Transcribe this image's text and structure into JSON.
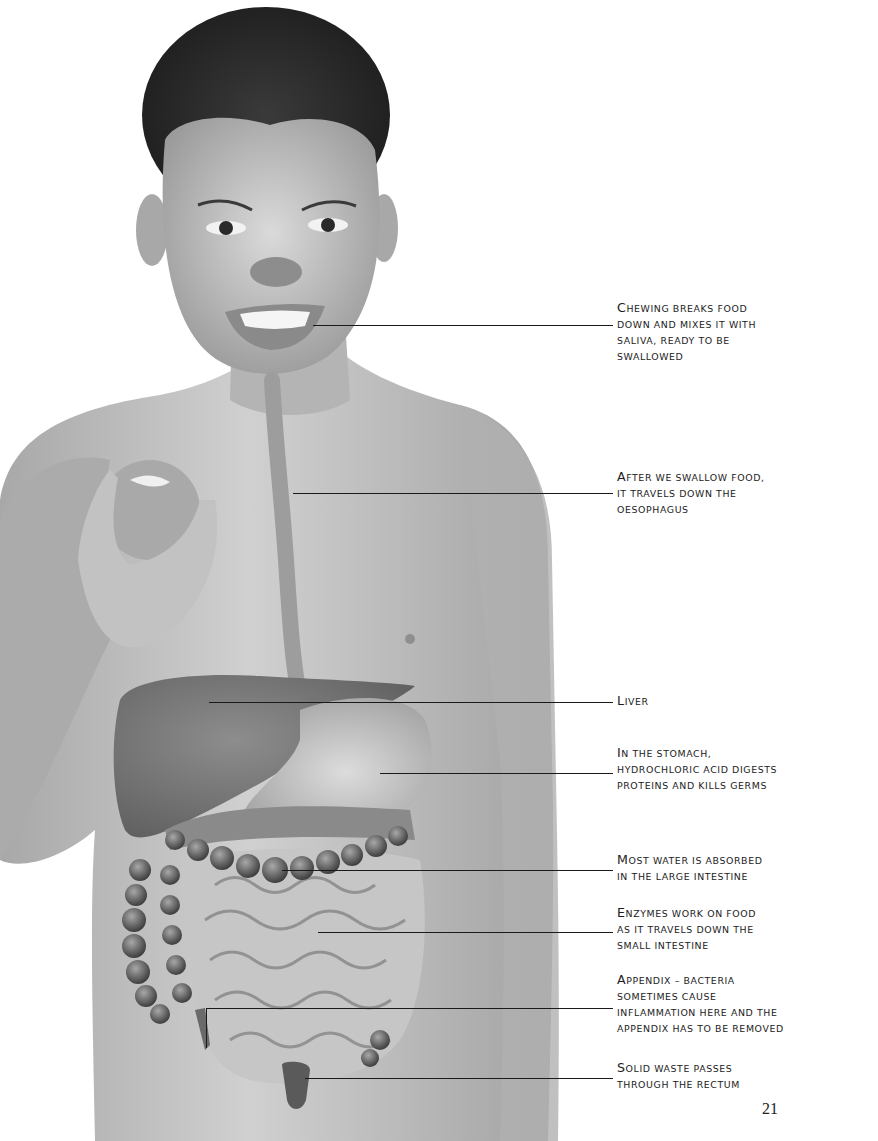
{
  "page": {
    "number": "21",
    "background": "#ffffff"
  },
  "illustration": {
    "subject": "child holding apple with digestive system overlay",
    "colors": {
      "skin": "#b9b9b9",
      "skin_light": "#d2d2d2",
      "hair": "#2a2a2a",
      "organ_dark": "#6e6e6e",
      "organ_mid": "#9a9a9a",
      "intestine": "#c9c9c9"
    }
  },
  "labels": [
    {
      "id": "mouth",
      "first": "C",
      "rest": "hewing breaks food",
      "lines": [
        "down and mixes it with",
        "saliva, ready to be",
        "swallowed"
      ],
      "top": 300,
      "line": {
        "x1": 313,
        "x2": 613,
        "y": 325
      }
    },
    {
      "id": "oesophagus",
      "first": "A",
      "rest": "fter we swallow food,",
      "lines": [
        "it travels down the",
        "oesophagus"
      ],
      "top": 469,
      "line": {
        "x1": 293,
        "x2": 613,
        "y": 493
      }
    },
    {
      "id": "liver",
      "first": "L",
      "rest": "iver",
      "lines": [],
      "top": 693,
      "line": {
        "x1": 209,
        "x2": 613,
        "y": 702
      }
    },
    {
      "id": "stomach",
      "first": "I",
      "rest": "n the stomach,",
      "lines": [
        "hydrochloric acid digests",
        "proteins and kills germs"
      ],
      "top": 745,
      "line": {
        "x1": 380,
        "x2": 613,
        "y": 773
      }
    },
    {
      "id": "large-intestine",
      "first": "M",
      "rest": "ost water is absorbed",
      "lines": [
        "in the large intestine"
      ],
      "top": 852,
      "line": {
        "x1": 282,
        "x2": 613,
        "y": 870
      }
    },
    {
      "id": "small-intestine",
      "first": "E",
      "rest": "nzymes work on food",
      "lines": [
        "as it travels down the",
        "small intestine"
      ],
      "top": 905,
      "line": {
        "x1": 318,
        "x2": 613,
        "y": 932
      }
    },
    {
      "id": "appendix",
      "first": "A",
      "rest": "ppendix – bacteria",
      "lines": [
        "sometimes cause",
        "inflammation here and the",
        "appendix has to be removed"
      ],
      "top": 972,
      "line": {
        "x1": 207,
        "x2": 613,
        "y": 1008
      }
    },
    {
      "id": "rectum",
      "first": "S",
      "rest": "olid waste passes",
      "lines": [
        "through the rectum"
      ],
      "top": 1060,
      "line": {
        "x1": 305,
        "x2": 613,
        "y": 1078
      }
    }
  ]
}
